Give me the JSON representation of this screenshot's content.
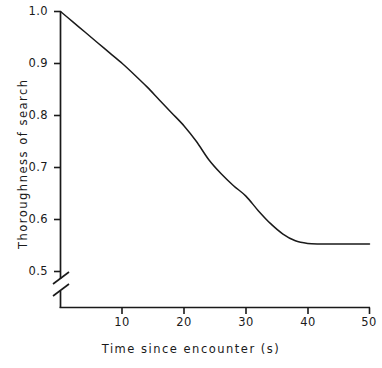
{
  "chart_data": {
    "type": "line",
    "title": "",
    "xlabel": "Time since encounter (s)",
    "ylabel": "Thoroughness of search",
    "xlim": [
      0,
      50
    ],
    "ylim": [
      0.5,
      1.0
    ],
    "grid": false,
    "legend": "none",
    "axis_break": {
      "axis": "y",
      "style": "double-slash",
      "note": "y-axis broken below 0.5"
    },
    "xticks": [
      10,
      20,
      30,
      40,
      50
    ],
    "xtick_labels": [
      "10",
      "20",
      "30",
      "40",
      "50"
    ],
    "yticks": [
      0.5,
      0.6,
      0.7,
      0.8,
      0.9,
      1.0
    ],
    "ytick_labels": [
      "0.5",
      "0.6",
      "0.7",
      "0.8",
      "0.9",
      "1.0"
    ],
    "line_color": "#1a1a1a",
    "series": [
      {
        "name": "Thoroughness of search",
        "x": [
          0,
          2,
          4,
          6,
          8,
          10,
          12,
          14,
          16,
          18,
          20,
          22,
          24,
          26,
          28,
          30,
          32,
          34,
          36,
          38,
          40,
          42,
          44,
          46,
          48,
          50
        ],
        "y": [
          1.0,
          0.98,
          0.96,
          0.94,
          0.92,
          0.9,
          0.878,
          0.855,
          0.83,
          0.805,
          0.78,
          0.75,
          0.715,
          0.688,
          0.665,
          0.645,
          0.617,
          0.592,
          0.572,
          0.559,
          0.554,
          0.553,
          0.553,
          0.553,
          0.553,
          0.553
        ]
      }
    ]
  },
  "axis": {
    "x_title": "Time since encounter (s)",
    "y_title": "Thoroughness of search"
  },
  "yticks": {
    "t0": "1.0",
    "t1": "0.9",
    "t2": "0.8",
    "t3": "0.7",
    "t4": "0.6",
    "t5": "0.5"
  },
  "xticks": {
    "t0": "10",
    "t1": "20",
    "t2": "30",
    "t3": "40",
    "t4": "50"
  }
}
